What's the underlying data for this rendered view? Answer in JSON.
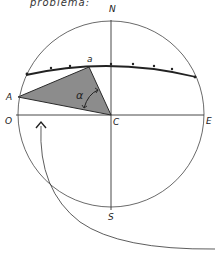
{
  "caption": "problema:",
  "labels": {
    "north": "N",
    "south": "S",
    "east": "E",
    "west": "O",
    "center": "C",
    "point_A": "A",
    "point_a": "a",
    "angle": "α"
  },
  "colors": {
    "stroke": "#2a2a2a",
    "triangle_fill": "#8c8c8c",
    "background": "#ffffff"
  }
}
